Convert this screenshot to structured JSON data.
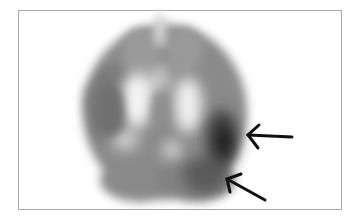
{
  "image": {
    "description": "Axial brain perfusion scan (grayscale) with two black arrows pointing to a dark region in the right posterior area",
    "frame_color": "#a8a8a8",
    "background": "#ffffff",
    "arrows": [
      {
        "name": "upper-arrow",
        "tip": [
          247,
          134
        ],
        "tail": [
          292,
          137
        ],
        "color": "#111111"
      },
      {
        "name": "lower-arrow",
        "tip": [
          226,
          178
        ],
        "tail": [
          266,
          199
        ],
        "color": "#111111"
      }
    ]
  }
}
